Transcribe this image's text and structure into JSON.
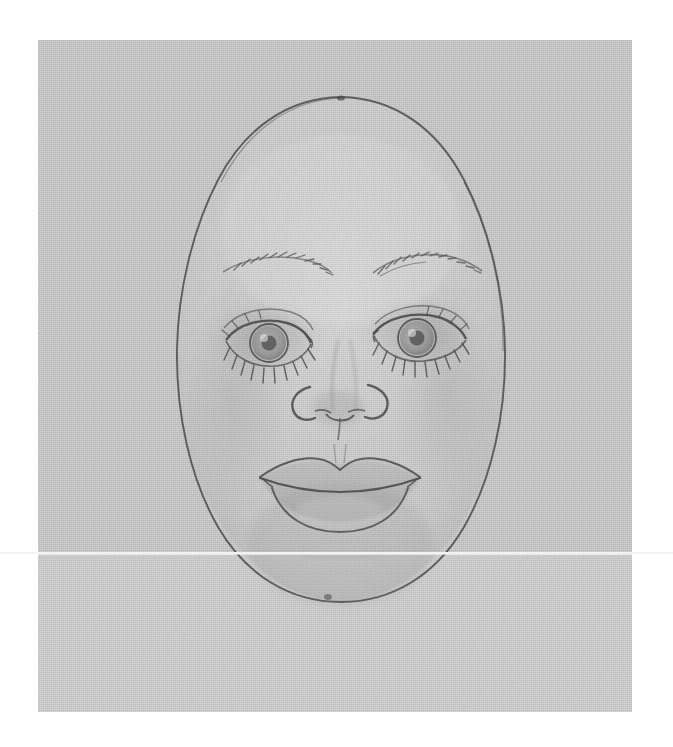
{
  "image": {
    "kind": "scanned-pencil-drawing",
    "subject": "doll face template",
    "width": 673,
    "height": 747,
    "background_color": "#ffffff"
  },
  "paper": {
    "label": "scanned paper sheet",
    "color": "#bcbcbc",
    "lower_band_color": "#c2c2c2",
    "left": 38,
    "top": 40,
    "width": 594,
    "height": 672
  },
  "artifacts": {
    "scan_line": {
      "label": "horizontal scanner seam line",
      "color": "#f3f3f3",
      "y": 552,
      "thickness": 2
    }
  },
  "drawing": {
    "title": "Pencil drawing of a doll face",
    "medium": "graphite pencil on textured paper",
    "stroke_color": "#5a5a5a",
    "soft_shade_color": "#9a9a9a",
    "parts": [
      {
        "name": "head-outline",
        "label": "Head outline",
        "shape": "oval"
      },
      {
        "name": "left-eyebrow",
        "label": "Left eyebrow"
      },
      {
        "name": "right-eyebrow",
        "label": "Right eyebrow"
      },
      {
        "name": "left-eye",
        "label": "Left eye"
      },
      {
        "name": "right-eye",
        "label": "Right eye"
      },
      {
        "name": "nose",
        "label": "Nose"
      },
      {
        "name": "mouth",
        "label": "Mouth"
      },
      {
        "name": "chin-shading",
        "label": "Chin shading"
      }
    ],
    "geometry": {
      "head": {
        "cx": 341,
        "cy": 349,
        "rx": 167,
        "ry": 253,
        "top_y": 96,
        "bottom_y": 602,
        "left_x": 174,
        "right_x": 508
      },
      "left_eye": {
        "cx": 265,
        "cy": 340
      },
      "right_eye": {
        "cx": 405,
        "cy": 335
      },
      "nose": {
        "cx": 338,
        "cy": 410
      },
      "mouth": {
        "cx": 341,
        "cy": 470
      }
    }
  }
}
